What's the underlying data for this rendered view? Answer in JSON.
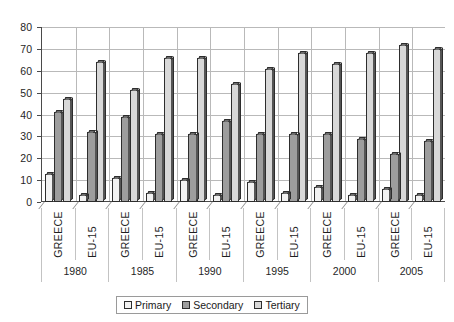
{
  "chart_data": {
    "type": "bar",
    "title": "",
    "xlabel": "",
    "ylabel": "",
    "ylim": [
      0,
      80
    ],
    "ytick_step": 10,
    "yticks": [
      0,
      10,
      20,
      30,
      40,
      50,
      60,
      70,
      80
    ],
    "grid": true,
    "legend_position": "bottom",
    "groups": [
      "1980",
      "1985",
      "1990",
      "1995",
      "2000",
      "2005"
    ],
    "subgroups": [
      "GREECE",
      "EU-15"
    ],
    "categories": [
      "1980 GREECE",
      "1980 EU-15",
      "1985 GREECE",
      "1985 EU-15",
      "1990 GREECE",
      "1990 EU-15",
      "1995 GREECE",
      "1995 EU-15",
      "2000 GREECE",
      "2000 EU-15",
      "2005 GREECE",
      "2005 EU-15"
    ],
    "series": [
      {
        "name": "Primary",
        "color": "#f2f2f2",
        "values": [
          13,
          3,
          11,
          4,
          10,
          3,
          9,
          4,
          7,
          3,
          6,
          3
        ]
      },
      {
        "name": "Secondary",
        "color": "#9d9d9d",
        "values": [
          41,
          32,
          39,
          31,
          31,
          37,
          31,
          31,
          31,
          29,
          22,
          28
        ]
      },
      {
        "name": "Tertiary",
        "color": "#d8d8d8",
        "values": [
          47,
          64,
          51,
          66,
          66,
          54,
          61,
          68,
          63,
          68,
          72,
          70
        ]
      }
    ],
    "legend": [
      {
        "label": "Primary",
        "color": "#f2f2f2"
      },
      {
        "label": "Secondary",
        "color": "#9d9d9d"
      },
      {
        "label": "Tertiary",
        "color": "#d8d8d8"
      }
    ]
  }
}
